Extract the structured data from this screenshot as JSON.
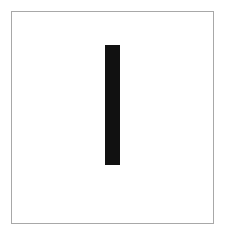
{
  "figure": {
    "title": "",
    "background_color": "#ffffff",
    "frame_color": "#a8a8a8",
    "width": 227,
    "height": 235
  },
  "chart_data": {
    "type": "bar",
    "title": "",
    "subtitle": "",
    "xlabel": "",
    "ylabel": "",
    "categories": [
      ""
    ],
    "values": [
      120
    ],
    "series": [
      {
        "name": "",
        "values": [
          120
        ],
        "color": "#111111"
      }
    ],
    "bar_color": "#111111",
    "bar_width_px": 15,
    "orientation": "vertical",
    "grid": false,
    "legend": false,
    "legend_position": "none",
    "xticks": [],
    "yticks": [],
    "xticklabels": [],
    "yticklabels": [],
    "xlim": [
      0,
      203
    ],
    "ylim": [
      0,
      213
    ],
    "annotations": []
  }
}
